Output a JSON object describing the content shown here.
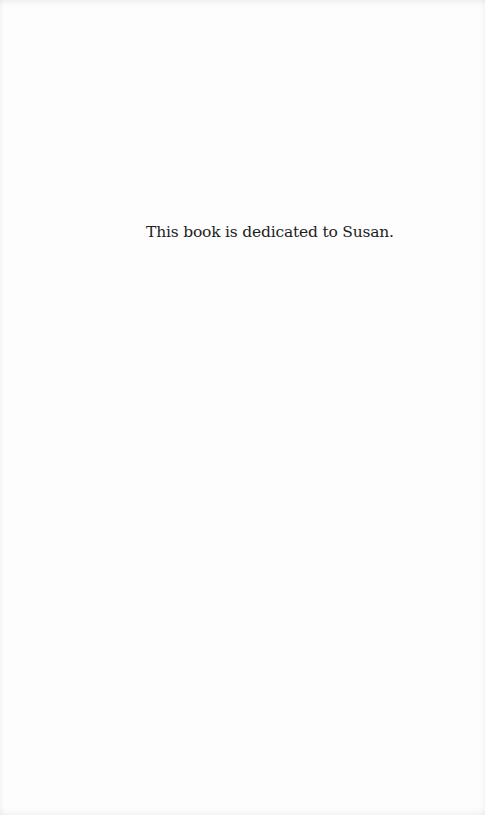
{
  "page": {
    "dedication_text": "This book is dedicated to Susan."
  }
}
